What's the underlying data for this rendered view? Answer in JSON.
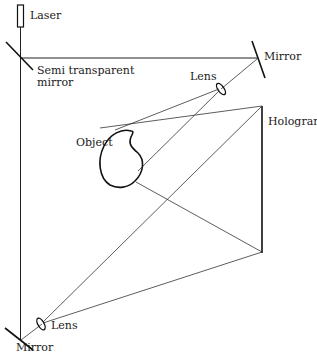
{
  "diagram": {
    "type": "holography-recording-setup",
    "labels": {
      "laser": "Laser",
      "semi_mirror_line1": "Semi transparent",
      "semi_mirror_line2": "mirror",
      "mirror_top": "Mirror",
      "lens_top": "Lens",
      "hologram": "Hologram",
      "object": "Object",
      "lens_bottom": "Lens",
      "mirror_bottom": "Mirror"
    },
    "colors": {
      "background": "#ffffff",
      "line": "#222222",
      "text": "#1a1a1a"
    }
  }
}
